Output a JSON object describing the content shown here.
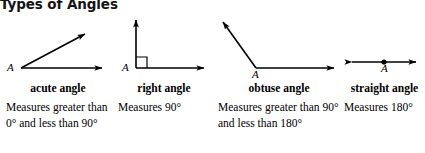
{
  "title": "Types of Angles",
  "columns": [
    {
      "id": "acute",
      "term": "acute angle",
      "vertex_label": "A",
      "description": "Measures greater than 0° and less than 90°",
      "diagram": "acute-angle-diagram"
    },
    {
      "id": "right",
      "term": "right angle",
      "vertex_label": "A",
      "description": "Measures 90°",
      "diagram": "right-angle-diagram"
    },
    {
      "id": "obtuse",
      "term": "obtuse angle",
      "vertex_label": "A",
      "description": "Measures greater than 90° and less than 180°",
      "diagram": "obtuse-angle-diagram"
    },
    {
      "id": "straight",
      "term": "straight angle",
      "vertex_label": "A",
      "description": "Measures 180°",
      "diagram": "straight-angle-diagram"
    }
  ],
  "colors": {
    "ink": "#000000",
    "title_ink": "#141414",
    "background": "#ffffff"
  }
}
